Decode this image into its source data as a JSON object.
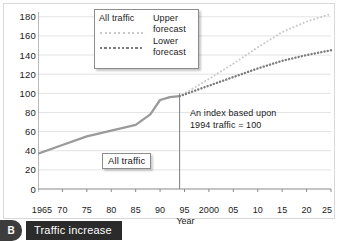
{
  "caption": {
    "badge": "B",
    "text": "Traffic increase"
  },
  "legend": {
    "series_label": "All traffic",
    "entries": [
      {
        "label": "Upper forecast",
        "key": "upper"
      },
      {
        "label": "Lower forecast",
        "key": "lower"
      }
    ]
  },
  "annotation": {
    "line1": "An index based upon",
    "line2": "1994 traffic = 100"
  },
  "callout": {
    "label": "All traffic"
  },
  "colors": {
    "all_traffic": "#9a9a9a",
    "upper_forecast": "#c9c9c9",
    "lower_forecast": "#7d7d7d",
    "gridline": "#e3e3e3",
    "axis": "#8a8a8a",
    "text": "#1a1a1a",
    "caption_bar": "#2b2b2b",
    "badge": "#3d3d3d"
  },
  "chart_data": {
    "type": "line",
    "title": "Traffic increase",
    "xlabel": "Year",
    "ylabel": "",
    "xlim": [
      1965,
      2025
    ],
    "ylim": [
      0,
      185
    ],
    "grid": true,
    "legend_position": "top-center",
    "yticks": [
      0,
      20,
      40,
      60,
      80,
      100,
      120,
      140,
      160,
      180
    ],
    "ytick_labels": [
      "0",
      "20",
      "40",
      "60",
      "80",
      "100",
      "120",
      "140",
      "160",
      "180"
    ],
    "xticks": [
      1965,
      1970,
      1975,
      1980,
      1985,
      1990,
      1995,
      2000,
      2005,
      2010,
      2015,
      2020,
      2025
    ],
    "xtick_labels": [
      "1965",
      "70",
      "75",
      "80",
      "85",
      "90",
      "95",
      "2000",
      "05",
      "10",
      "15",
      "20",
      "25"
    ],
    "index_base_year": 1994,
    "index_base_value": 100,
    "vertical_marker": {
      "x": 1994,
      "y_top": 100,
      "label": "1994"
    },
    "series": [
      {
        "name": "All traffic",
        "style": "solid",
        "color": "#9a9a9a",
        "x": [
          1965,
          1970,
          1975,
          1980,
          1985,
          1988,
          1990,
          1992,
          1994
        ],
        "values": [
          37,
          46,
          55,
          61,
          67,
          78,
          93,
          96,
          97
        ]
      },
      {
        "name": "Upper forecast",
        "style": "dotted",
        "color": "#c9c9c9",
        "x": [
          1994,
          2000,
          2005,
          2010,
          2015,
          2020,
          2025
        ],
        "values": [
          97,
          115,
          131,
          148,
          164,
          175,
          183
        ]
      },
      {
        "name": "Lower forecast",
        "style": "dotted",
        "color": "#7d7d7d",
        "x": [
          1994,
          2000,
          2005,
          2010,
          2015,
          2020,
          2025
        ],
        "values": [
          97,
          108,
          117,
          126,
          134,
          140,
          145
        ]
      }
    ]
  }
}
